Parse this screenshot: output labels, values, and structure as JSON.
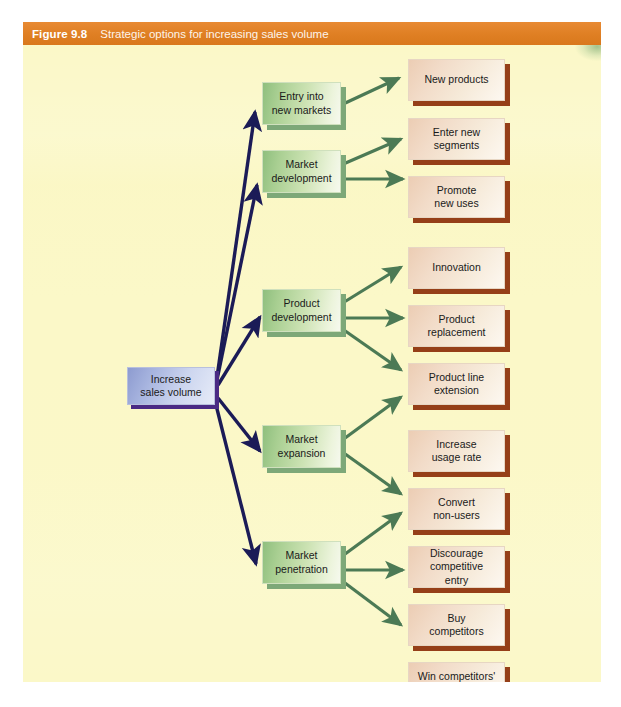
{
  "figure": {
    "label": "Figure 9.8",
    "title": "Strategic options for increasing sales volume",
    "title_bar_color": "#df7f23",
    "canvas_color": "#fbf8c8"
  },
  "colors": {
    "primary_arrow": "#1b1b57",
    "secondary_arrow": "#4c7a55",
    "center_node_shadow": "#4a2a84",
    "green_node_shadow": "#7da878",
    "cream_node_shadow": "#953f18"
  },
  "root": {
    "label": "Increase\nsales volume",
    "line1": "Increase",
    "line2": "sales volume"
  },
  "strategies": [
    {
      "id": "entry-into-new-markets",
      "line1": "Entry into",
      "line2": "new markets",
      "options": [
        {
          "id": "new-products",
          "line1": "New products",
          "line2": ""
        }
      ]
    },
    {
      "id": "market-development",
      "line1": "Market",
      "line2": "development",
      "options": [
        {
          "id": "enter-new-segments",
          "line1": "Enter new",
          "line2": "segments"
        },
        {
          "id": "promote-new-uses",
          "line1": "Promote",
          "line2": "new uses"
        }
      ]
    },
    {
      "id": "product-development",
      "line1": "Product",
      "line2": "development",
      "options": [
        {
          "id": "innovation",
          "line1": "Innovation",
          "line2": ""
        },
        {
          "id": "product-replacement",
          "line1": "Product",
          "line2": "replacement"
        },
        {
          "id": "product-line-extension",
          "line1": "Product line",
          "line2": "extension"
        }
      ]
    },
    {
      "id": "market-expansion",
      "line1": "Market",
      "line2": "expansion",
      "options": [
        {
          "id": "increase-usage-rate",
          "line1": "Increase",
          "line2": "usage rate"
        },
        {
          "id": "convert-non-users",
          "line1": "Convert",
          "line2": "non-users"
        }
      ]
    },
    {
      "id": "market-penetration",
      "line1": "Market",
      "line2": "penetration",
      "options": [
        {
          "id": "discourage-competitive-entry",
          "line1": "Discourage",
          "line2": "competitive entry"
        },
        {
          "id": "buy-competitors",
          "line1": "Buy",
          "line2": "competitors"
        },
        {
          "id": "win-competitors-customers",
          "line1": "Win competitors'",
          "line2": "customers"
        }
      ]
    }
  ]
}
